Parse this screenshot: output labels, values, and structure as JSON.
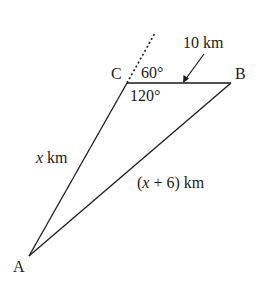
{
  "diagram": {
    "type": "triangle",
    "points": {
      "A": {
        "label": "A",
        "x": 29,
        "y": 256
      },
      "B": {
        "label": "B",
        "x": 231,
        "y": 83
      },
      "C": {
        "label": "C",
        "x": 127,
        "y": 83
      }
    },
    "sides": {
      "CB": {
        "label": "10 km"
      },
      "CA": {
        "var": "x",
        "unit": " km"
      },
      "AB": {
        "open": "(",
        "var": "x",
        "rest": " + 6) km"
      }
    },
    "angles": {
      "exterior_C": "60°",
      "interior_C": "120°"
    },
    "colors": {
      "stroke": "#1a1a1a",
      "background": "#ffffff"
    }
  }
}
